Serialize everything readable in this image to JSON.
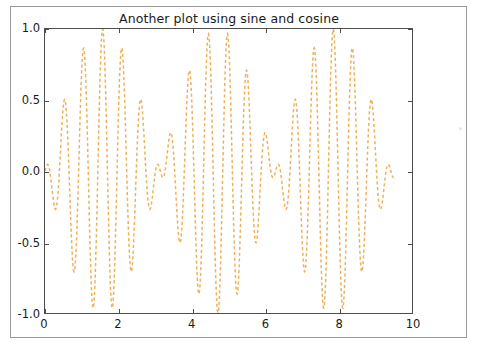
{
  "figure": {
    "background": "#ffffff",
    "frame_color": "#9a9a9a",
    "axes_color": "#4d4d4d",
    "speck_name": "stray-speck"
  },
  "chart_data": {
    "type": "line",
    "title": "Another plot using sine and cosine",
    "xlabel": "",
    "ylabel": "",
    "xlim": [
      0,
      10
    ],
    "ylim": [
      -1.0,
      1.0
    ],
    "grid": false,
    "legend": null,
    "legend_position": "none",
    "xticks": [
      0,
      2,
      4,
      6,
      8,
      10
    ],
    "xtick_labels": [
      "0",
      "2",
      "4",
      "6",
      "8",
      "10"
    ],
    "yticks": [
      -1.0,
      -0.5,
      0.0,
      0.5,
      1.0
    ],
    "ytick_labels": [
      "-1.0",
      "-0.5",
      "0.0",
      "0.5",
      "1.0"
    ],
    "series": [
      {
        "name": "sin(x)*cos(12x)",
        "color": "#eeb15a",
        "linestyle": "dashed",
        "linewidth": 1.5,
        "expression": "sin(x) * cos(12*x)",
        "x_start": 0,
        "x_end": 9.5,
        "n_points": 900,
        "description": "High-frequency carrier cos(12x) amplitude-modulated by sin(x); produces a beat/interference envelope spanning -1.0 to 1.0.",
        "sample_points": [
          {
            "x": 0.0,
            "y": 0.0
          },
          {
            "x": 0.13,
            "y": 0.08
          },
          {
            "x": 0.26,
            "y": -0.25
          },
          {
            "x": 0.39,
            "y": 0.37
          },
          {
            "x": 0.52,
            "y": -0.46
          },
          {
            "x": 0.65,
            "y": 0.55
          },
          {
            "x": 0.79,
            "y": -0.66
          },
          {
            "x": 0.92,
            "y": 0.75
          },
          {
            "x": 1.05,
            "y": -0.82
          },
          {
            "x": 1.18,
            "y": 0.89
          },
          {
            "x": 1.31,
            "y": -0.95
          },
          {
            "x": 1.44,
            "y": 0.98
          },
          {
            "x": 1.57,
            "y": -1.0
          },
          {
            "x": 1.7,
            "y": 0.99
          },
          {
            "x": 1.83,
            "y": -0.96
          },
          {
            "x": 1.96,
            "y": 0.91
          },
          {
            "x": 2.09,
            "y": -0.85
          },
          {
            "x": 2.22,
            "y": 0.77
          },
          {
            "x": 2.36,
            "y": -0.67
          },
          {
            "x": 2.49,
            "y": 0.57
          },
          {
            "x": 2.62,
            "y": -0.47
          },
          {
            "x": 2.75,
            "y": 0.36
          },
          {
            "x": 2.88,
            "y": -0.25
          },
          {
            "x": 3.01,
            "y": 0.13
          },
          {
            "x": 3.14,
            "y": 0.0
          },
          {
            "x": 3.4,
            "y": -0.25
          },
          {
            "x": 3.67,
            "y": 0.5
          },
          {
            "x": 3.93,
            "y": -0.71
          },
          {
            "x": 4.19,
            "y": 0.87
          },
          {
            "x": 4.45,
            "y": -0.97
          },
          {
            "x": 4.71,
            "y": 1.0
          },
          {
            "x": 4.97,
            "y": -0.97
          },
          {
            "x": 5.24,
            "y": 0.87
          },
          {
            "x": 5.5,
            "y": -0.71
          },
          {
            "x": 5.76,
            "y": 0.5
          },
          {
            "x": 6.02,
            "y": -0.25
          },
          {
            "x": 6.28,
            "y": 0.0
          },
          {
            "x": 6.55,
            "y": 0.25
          },
          {
            "x": 6.81,
            "y": -0.5
          },
          {
            "x": 7.07,
            "y": 0.71
          },
          {
            "x": 7.33,
            "y": -0.87
          },
          {
            "x": 7.6,
            "y": 0.97
          },
          {
            "x": 7.85,
            "y": -1.0
          },
          {
            "x": 8.12,
            "y": 0.97
          },
          {
            "x": 8.38,
            "y": -0.87
          },
          {
            "x": 8.64,
            "y": 0.71
          },
          {
            "x": 8.9,
            "y": -0.5
          },
          {
            "x": 9.16,
            "y": 0.25
          },
          {
            "x": 9.42,
            "y": 0.0
          },
          {
            "x": 9.5,
            "y": -0.08
          }
        ]
      }
    ]
  }
}
